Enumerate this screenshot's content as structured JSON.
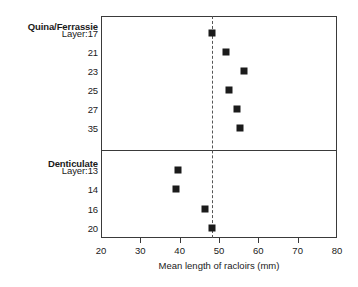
{
  "chart_data": {
    "type": "scatter",
    "title": "",
    "xlabel": "Mean length of racloirs (mm)",
    "ylabel": "",
    "xlim": [
      20,
      80
    ],
    "xticks": [
      20,
      30,
      40,
      50,
      60,
      70,
      80
    ],
    "xtick_labels": [
      "20",
      "30",
      "40",
      "50",
      "60",
      "70",
      "80"
    ],
    "grid": false,
    "legend": "none",
    "reference_line": {
      "orientation": "vertical",
      "value": 48.2,
      "style": "dashed"
    },
    "panels": [
      {
        "name": "Quina/Ferrassie",
        "group_label": "Quina/Ferrassie",
        "categories": [
          "Layer:17",
          "21",
          "23",
          "25",
          "27",
          "35"
        ],
        "values": [
          48.2,
          51.8,
          56.4,
          52.6,
          54.6,
          55.4
        ]
      },
      {
        "name": "Denticulate",
        "group_label": "Denticulate",
        "categories": [
          "Layer:13",
          "14",
          "16",
          "20"
        ],
        "values": [
          39.6,
          39.1,
          46.4,
          48.2
        ]
      }
    ]
  },
  "axis": {
    "x_title": "Mean length of racloirs (mm)"
  },
  "colors": {
    "marker": "#1b1b1b",
    "frame": "#3a3a3a",
    "reference_line": "#555555",
    "background": "#ffffff"
  }
}
